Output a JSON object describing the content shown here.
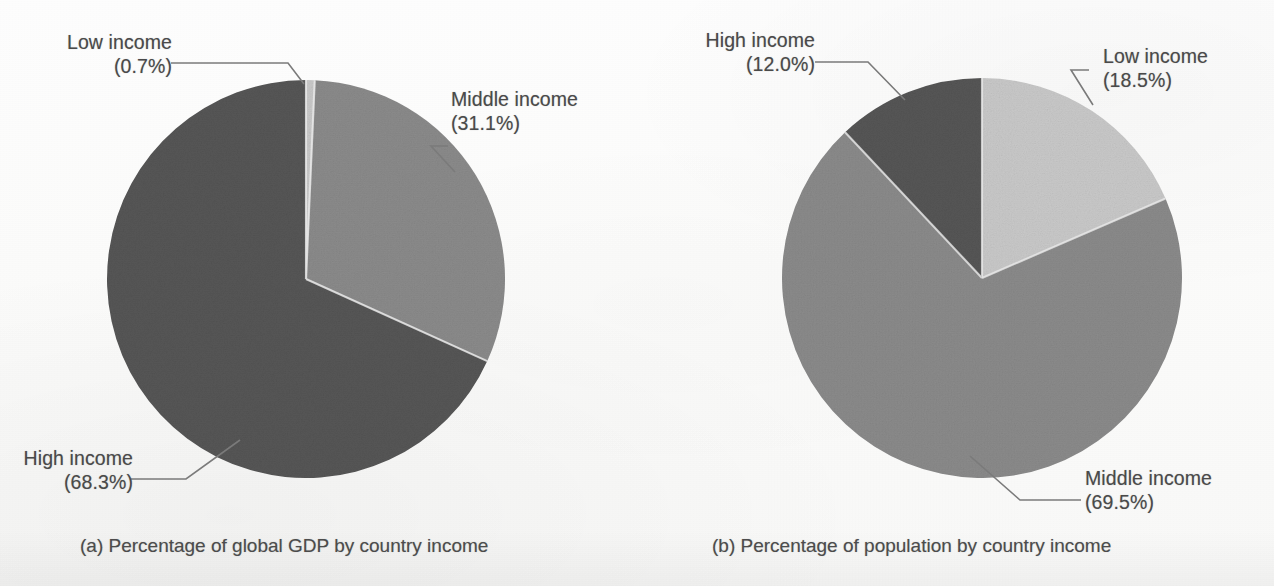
{
  "figure": {
    "background_color": "#fbfbfa",
    "text_color": "#4a4a4a",
    "leader_line_color": "#7b7b7b"
  },
  "palette": {
    "low_income": "#c9c9c9",
    "middle_income": "#8b8b8b",
    "high_income": "#565656",
    "slice_divider": "#f2f2f2"
  },
  "chart_data": [
    {
      "type": "pie",
      "id": "global-gdp",
      "title": "(a) Percentage of global GDP by country income",
      "unit": "%",
      "start_angle_deg": 0,
      "direction": "clockwise",
      "center": {
        "x": 306,
        "y": 279
      },
      "radius": 199,
      "categories": [
        "Low income",
        "Middle income",
        "High income"
      ],
      "values": [
        0.7,
        31.1,
        68.3
      ],
      "slices": [
        {
          "label": "Low income",
          "value": 0.7,
          "value_text": "(0.7%)",
          "color": "#c9c9c9"
        },
        {
          "label": "Middle income",
          "value": 31.1,
          "value_text": "(31.1%)",
          "color": "#8b8b8b"
        },
        {
          "label": "High income",
          "value": 68.3,
          "value_text": "(68.3%)",
          "color": "#565656"
        }
      ],
      "legend_position": "callout-labels",
      "grid": false
    },
    {
      "type": "pie",
      "id": "global-population",
      "title": "(b) Percentage of population by country income",
      "unit": "%",
      "start_angle_deg": 0,
      "direction": "clockwise",
      "center": {
        "x": 345,
        "y": 278
      },
      "radius": 200,
      "categories": [
        "Low income",
        "Middle income",
        "High income"
      ],
      "values": [
        18.5,
        69.5,
        12.0
      ],
      "slices": [
        {
          "label": "Low income",
          "value": 18.5,
          "value_text": "(18.5%)",
          "color": "#c9c9c9"
        },
        {
          "label": "Middle income",
          "value": 69.5,
          "value_text": "(69.5%)",
          "color": "#8b8b8b"
        },
        {
          "label": "High income",
          "value": 12.0,
          "value_text": "(12.0%)",
          "color": "#565656"
        }
      ],
      "legend_position": "callout-labels",
      "grid": false
    }
  ],
  "panel_a": {
    "caption": "(a) Percentage of global GDP by country income",
    "labels": {
      "low": {
        "name": "Low income",
        "value": "(0.7%)"
      },
      "middle": {
        "name": "Middle income",
        "value": "(31.1%)"
      },
      "high": {
        "name": "High income",
        "value": "(68.3%)"
      }
    }
  },
  "panel_b": {
    "caption": "(b) Percentage of population by country income",
    "labels": {
      "high": {
        "name": "High income",
        "value": "(12.0%)"
      },
      "low": {
        "name": "Low income",
        "value": "(18.5%)"
      },
      "middle": {
        "name": "Middle income",
        "value": "(69.5%)"
      }
    }
  }
}
